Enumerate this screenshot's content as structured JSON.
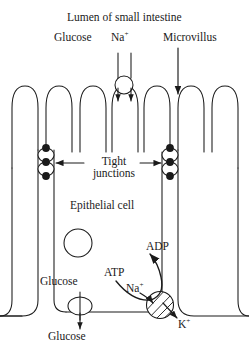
{
  "figure": {
    "stroke_color": "#1a1a1a",
    "fill_color": "#ffffff"
  },
  "labels": {
    "lumen": "Lumen of small intestine",
    "glucose_apical": "Glucose",
    "sodium_apical": "Na",
    "sodium_sup": "+",
    "microvillus": "Microvillus",
    "tight_junctions_line1": "Tight",
    "tight_junctions_line2": "junctions",
    "epithelial_cell": "Epithelial cell",
    "glucose_cytoplasm": "Glucose",
    "glucose_basal": "Glucose",
    "atp": "ATP",
    "adp": "ADP",
    "sodium_pump": "Na",
    "sodium_pump_sup": "+",
    "potassium_pump": "K",
    "potassium_pump_sup": "+"
  },
  "structures": {
    "microvilli_count": 7,
    "tight_junction_left_x": 46,
    "tight_junction_right_x": 170,
    "nucleus": {
      "cx": 78,
      "cy": 243,
      "r": 14
    },
    "cotransporter": {
      "cx": 124,
      "cy": 85,
      "r": 9
    },
    "glucose_transporter": {
      "cx": 80,
      "cy": 306,
      "rx": 12,
      "ry": 9
    },
    "sodium_potassium_pump": {
      "cx": 160,
      "cy": 305,
      "r": 14
    }
  }
}
